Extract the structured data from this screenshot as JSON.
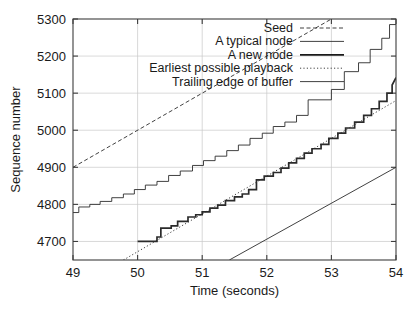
{
  "chart_data": {
    "type": "line",
    "title": "",
    "xlabel": "Time (seconds)",
    "ylabel": "Sequence number",
    "xlim": [
      49,
      54
    ],
    "ylim": [
      4650,
      5300
    ],
    "xticks": [
      49,
      50,
      51,
      52,
      53,
      54
    ],
    "yticks": [
      4700,
      4800,
      4900,
      5000,
      5100,
      5200,
      5300
    ],
    "xtick_labels": [
      "49",
      "50",
      "51",
      "52",
      "53",
      "54"
    ],
    "ytick_labels": [
      "4700",
      "4800",
      "4900",
      "5000",
      "5100",
      "5200",
      "5300"
    ],
    "grid": true,
    "legend_position": "top-right-inside",
    "series": [
      {
        "name": "Seed",
        "style": "dashed-fine",
        "color": "#2b2b2b",
        "width": 0.9,
        "points": [
          [
            49,
            4900
          ],
          [
            53,
            5300
          ]
        ]
      },
      {
        "name": "A typical node",
        "style": "solid",
        "color": "#2b2b2b",
        "width": 0.9,
        "points": [
          [
            49,
            4778
          ],
          [
            49.09,
            4778
          ],
          [
            49.09,
            4793
          ],
          [
            49.26,
            4793
          ],
          [
            49.26,
            4800
          ],
          [
            49.42,
            4800
          ],
          [
            49.42,
            4808
          ],
          [
            49.6,
            4808
          ],
          [
            49.6,
            4818
          ],
          [
            49.78,
            4818
          ],
          [
            49.78,
            4828
          ],
          [
            49.95,
            4828
          ],
          [
            49.95,
            4840
          ],
          [
            50.12,
            4840
          ],
          [
            50.12,
            4852
          ],
          [
            50.3,
            4852
          ],
          [
            50.3,
            4862
          ],
          [
            50.48,
            4862
          ],
          [
            50.48,
            4878
          ],
          [
            50.66,
            4878
          ],
          [
            50.66,
            4890
          ],
          [
            50.85,
            4890
          ],
          [
            50.85,
            4905
          ],
          [
            51.02,
            4905
          ],
          [
            51.02,
            4918
          ],
          [
            51.2,
            4918
          ],
          [
            51.2,
            4930
          ],
          [
            51.38,
            4930
          ],
          [
            51.38,
            4945
          ],
          [
            51.56,
            4945
          ],
          [
            51.56,
            4960
          ],
          [
            51.74,
            4960
          ],
          [
            51.74,
            4978
          ],
          [
            51.93,
            4978
          ],
          [
            51.93,
            4992
          ],
          [
            52.1,
            4992
          ],
          [
            52.1,
            5010
          ],
          [
            52.28,
            5010
          ],
          [
            52.28,
            5022
          ],
          [
            52.46,
            5022
          ],
          [
            52.46,
            5040
          ],
          [
            52.64,
            5040
          ],
          [
            52.64,
            5082
          ],
          [
            53.0,
            5082
          ],
          [
            53.0,
            5110
          ],
          [
            53.2,
            5110
          ],
          [
            53.2,
            5158
          ],
          [
            53.42,
            5158
          ],
          [
            53.42,
            5182
          ],
          [
            53.6,
            5182
          ],
          [
            53.6,
            5218
          ],
          [
            53.78,
            5218
          ],
          [
            53.78,
            5248
          ],
          [
            53.9,
            5248
          ],
          [
            53.9,
            5285
          ],
          [
            54,
            5285
          ]
        ]
      },
      {
        "name": "A new node",
        "style": "solid-thick",
        "color": "#1a1a1a",
        "width": 1.7,
        "points": [
          [
            50,
            4700
          ],
          [
            50.3,
            4700
          ],
          [
            50.3,
            4712
          ],
          [
            50.36,
            4712
          ],
          [
            50.36,
            4736
          ],
          [
            50.52,
            4736
          ],
          [
            50.52,
            4742
          ],
          [
            50.62,
            4742
          ],
          [
            50.62,
            4754
          ],
          [
            50.78,
            4754
          ],
          [
            50.78,
            4766
          ],
          [
            50.9,
            4766
          ],
          [
            50.9,
            4772
          ],
          [
            51.0,
            4772
          ],
          [
            51.0,
            4780
          ],
          [
            51.12,
            4780
          ],
          [
            51.12,
            4790
          ],
          [
            51.24,
            4790
          ],
          [
            51.24,
            4798
          ],
          [
            51.36,
            4798
          ],
          [
            51.36,
            4810
          ],
          [
            51.5,
            4810
          ],
          [
            51.5,
            4820
          ],
          [
            51.62,
            4820
          ],
          [
            51.62,
            4828
          ],
          [
            51.72,
            4828
          ],
          [
            51.72,
            4840
          ],
          [
            51.84,
            4840
          ],
          [
            51.84,
            4866
          ],
          [
            51.96,
            4866
          ],
          [
            51.96,
            4876
          ],
          [
            52.1,
            4876
          ],
          [
            52.1,
            4886
          ],
          [
            52.22,
            4886
          ],
          [
            52.22,
            4898
          ],
          [
            52.34,
            4898
          ],
          [
            52.34,
            4912
          ],
          [
            52.46,
            4912
          ],
          [
            52.46,
            4924
          ],
          [
            52.58,
            4924
          ],
          [
            52.58,
            4938
          ],
          [
            52.7,
            4938
          ],
          [
            52.7,
            4950
          ],
          [
            52.84,
            4950
          ],
          [
            52.84,
            4962
          ],
          [
            52.96,
            4962
          ],
          [
            52.96,
            4978
          ],
          [
            53.1,
            4978
          ],
          [
            53.1,
            4992
          ],
          [
            53.22,
            4992
          ],
          [
            53.22,
            5006
          ],
          [
            53.36,
            5006
          ],
          [
            53.36,
            5022
          ],
          [
            53.5,
            5022
          ],
          [
            53.5,
            5040
          ],
          [
            53.62,
            5040
          ],
          [
            53.62,
            5058
          ],
          [
            53.74,
            5058
          ],
          [
            53.74,
            5078
          ],
          [
            53.86,
            5078
          ],
          [
            53.86,
            5100
          ],
          [
            53.94,
            5100
          ],
          [
            53.94,
            5122
          ],
          [
            54,
            5142
          ]
        ]
      },
      {
        "name": "Earliest possible playback",
        "style": "dotted",
        "color": "#2b2b2b",
        "width": 0.9,
        "points": [
          [
            49.78,
            4650
          ],
          [
            54,
            5080
          ]
        ]
      },
      {
        "name": "Trailing edge of buffer",
        "style": "solid-thin",
        "color": "#2b2b2b",
        "width": 0.9,
        "points": [
          [
            51.42,
            4650
          ],
          [
            54,
            4900
          ]
        ]
      }
    ]
  },
  "legend": {
    "entries": [
      {
        "label": "Seed",
        "key": "seed"
      },
      {
        "label": "A typical node",
        "key": "typical-node"
      },
      {
        "label": "A new node",
        "key": "new-node"
      },
      {
        "label": "Earliest possible playback",
        "key": "earliest-playback"
      },
      {
        "label": "Trailing edge of buffer",
        "key": "trailing-edge"
      }
    ]
  }
}
